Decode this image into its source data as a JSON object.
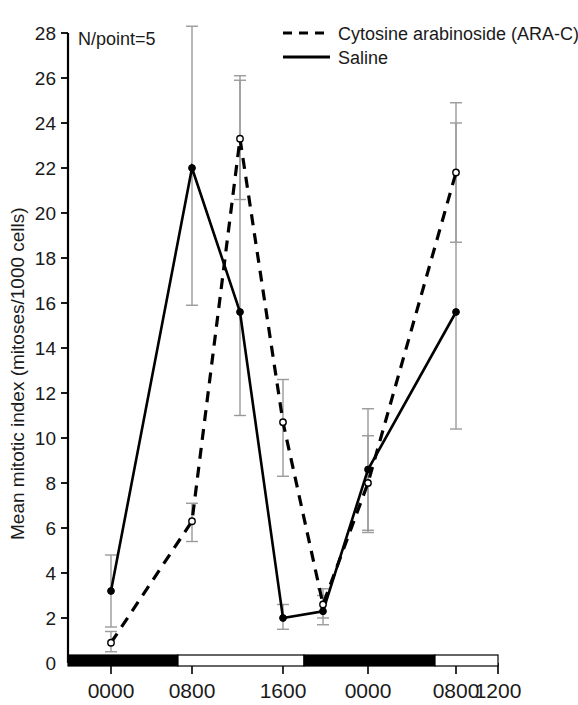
{
  "chart_data": {
    "type": "line",
    "title": "",
    "xlabel": "",
    "ylabel": "Mean mitotic index (mitoses/1000 cells)",
    "annotation": "N/point=5",
    "ylim": [
      0,
      28
    ],
    "yticks": [
      0,
      2,
      4,
      6,
      8,
      10,
      12,
      14,
      16,
      18,
      20,
      22,
      24,
      26,
      28
    ],
    "ytick_labels": [
      "0",
      "2",
      "4",
      "6",
      "8",
      "10",
      "12",
      "14",
      "16",
      "18",
      "20",
      "22",
      "24",
      "26",
      "28"
    ],
    "xtick_labels": [
      "0000",
      "0800",
      "1600",
      "0000",
      "0800",
      "1200"
    ],
    "xtick_positions": [
      111,
      192,
      283,
      368,
      456,
      498
    ],
    "grid": false,
    "legend_position": "top-right",
    "legend": [
      {
        "label": "Cytosine arabinoside (ARA-C)",
        "style": "dashed",
        "marker": "open-circle"
      },
      {
        "label": "Saline",
        "style": "solid",
        "marker": "filled-circle"
      }
    ],
    "x_sample_times": [
      "0000",
      "0800",
      "1200",
      "1600",
      "1800",
      "0000",
      "0400",
      "0800",
      "1000"
    ],
    "series": [
      {
        "name": "Cytosine arabinoside (ARA-C)",
        "style": "dashed",
        "marker": "open-circle",
        "points": [
          {
            "x_px": 111,
            "value": 0.9,
            "err_low": 0.5,
            "err_high": 1.4
          },
          {
            "x_px": 192,
            "value": 6.3,
            "err_low": 5.4,
            "err_high": 7.1
          },
          {
            "x_px": 240,
            "value": 23.3,
            "err_low": 20.6,
            "err_high": 26.1
          },
          {
            "x_px": 283,
            "value": 10.7,
            "err_low": 8.3,
            "err_high": 12.6
          },
          {
            "x_px": 323,
            "value": 2.6,
            "err_low": 2.0,
            "err_high": 3.3
          },
          {
            "x_px": 368,
            "value": 8.0,
            "err_low": 5.8,
            "err_high": 10.1
          },
          {
            "x_px": 456,
            "value": 21.8,
            "err_low": 18.7,
            "err_high": 24.9
          }
        ]
      },
      {
        "name": "Saline",
        "style": "solid",
        "marker": "filled-circle",
        "points": [
          {
            "x_px": 111,
            "value": 3.2,
            "err_low": 1.6,
            "err_high": 4.8
          },
          {
            "x_px": 192,
            "value": 22.0,
            "err_low": 15.9,
            "err_high": 28.3
          },
          {
            "x_px": 240,
            "value": 15.6,
            "err_low": 11.0,
            "err_high": 25.9
          },
          {
            "x_px": 283,
            "value": 2.0,
            "err_low": 1.5,
            "err_high": 2.6
          },
          {
            "x_px": 323,
            "value": 2.3,
            "err_low": 1.7,
            "err_high": 3.0
          },
          {
            "x_px": 368,
            "value": 8.6,
            "err_low": 5.9,
            "err_high": 11.3
          },
          {
            "x_px": 456,
            "value": 15.6,
            "err_low": 10.4,
            "err_high": 24.0
          }
        ]
      }
    ],
    "light_dark_bar": [
      {
        "from_px": 68,
        "to_px": 178,
        "phase": "dark",
        "color": "#000000"
      },
      {
        "from_px": 178,
        "to_px": 304,
        "phase": "light",
        "color": "#ffffff"
      },
      {
        "from_px": 304,
        "to_px": 435,
        "phase": "dark",
        "color": "#000000"
      },
      {
        "from_px": 435,
        "to_px": 498,
        "phase": "light",
        "color": "#ffffff"
      }
    ]
  },
  "colors": {
    "ink": "#1a1a1a",
    "axis": "#000000",
    "errorbar": "#9a9a9a",
    "saline": "#000000",
    "arac": "#000000"
  }
}
